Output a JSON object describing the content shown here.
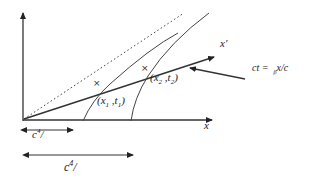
{
  "diagram": {
    "type": "spacetime-diagram",
    "axes": {
      "x_label": "x",
      "x_prime_label": "x'"
    },
    "events": [
      {
        "label_x": "x",
        "sub_x": "1",
        "label_t": "t",
        "sub_t": "1",
        "marker": "×"
      },
      {
        "label_x": "x",
        "sub_x": "2",
        "label_t": "t",
        "sub_t": "2",
        "marker": "×"
      }
    ],
    "equation": {
      "lhs": "ct =",
      "sub": "β",
      "rhs": "x/c"
    },
    "spans": [
      {
        "label": "c",
        "sup": "4",
        "suffix": "/"
      },
      {
        "label": "c",
        "sup": "4",
        "suffix": "/"
      }
    ],
    "colors": {
      "line": "#333333",
      "background": "#ffffff"
    }
  }
}
